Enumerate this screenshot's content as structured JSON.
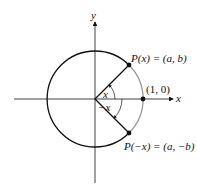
{
  "diagram": {
    "axes": {
      "x_label": "x",
      "y_label": "y"
    },
    "points": {
      "upper": "P(x) = (a, b)",
      "lower": "P(−x) = (a, −b)",
      "unit": "(1, 0)"
    },
    "angles": {
      "positive": "x",
      "negative": "−x"
    },
    "angle_degrees": 45,
    "colors": {
      "circle": "#111111",
      "arc_highlight": "#999999",
      "axes": "#111111"
    }
  }
}
